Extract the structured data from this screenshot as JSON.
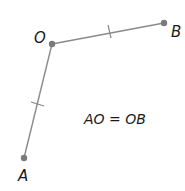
{
  "diagram": {
    "points": [
      {
        "id": "O",
        "label": "O",
        "x": 52,
        "y": 44
      },
      {
        "id": "B",
        "label": "B",
        "x": 164,
        "y": 23
      },
      {
        "id": "A",
        "label": "A",
        "x": 24,
        "y": 158
      }
    ],
    "segments": [
      {
        "from": "O",
        "to": "B",
        "tick_marks": 1
      },
      {
        "from": "A",
        "to": "O",
        "tick_marks": 1
      }
    ],
    "equation": "AO = OB",
    "colors": {
      "line": "#8a8a8a",
      "point": "#7a7a7a",
      "text": "#1a1a1a"
    }
  }
}
